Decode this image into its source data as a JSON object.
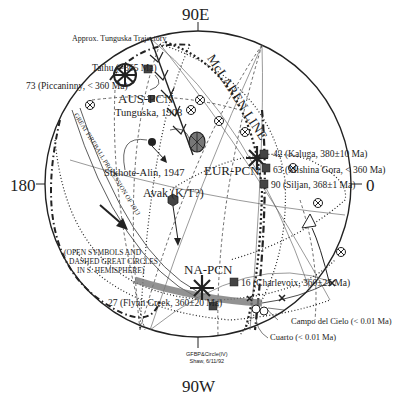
{
  "diagram": {
    "type": "stereographic polar projection",
    "axes": {
      "top": "90E",
      "bottom": "90W",
      "left": "180",
      "right": "0"
    },
    "titles": {
      "mclaren_line": "McLAREN LINE",
      "procession": "GREAT FIREBALL PROCESSION OF 1913",
      "trajectory": "Approx. Tunguska Trajectory"
    },
    "pole_clusters": {
      "aus": "AUS-PCN",
      "eur": "EUR-PCN",
      "na": "NA-PCN"
    },
    "sites": {
      "taihu": "Taihu (~365 Ma)",
      "piccaninny": "73 (Piccaninny, < 360 Ma)",
      "tunguska": "Tunguska, 1908",
      "sikhote": "Sikhote-Alin, 1947",
      "avak": "Avak (K/T?)",
      "kaluga": "42 (Kaluga, 380±10 Ma)",
      "mishina": "63 (Mishina Gora, < 360 Ma)",
      "siljan": "90 (Siljan, 368±1 Ma)",
      "charlevoix": "16 (Charlevoix, 360±25 Ma)",
      "flynn": "27 (Flynn Creek, 360±20 Ma)",
      "campo": "Campo del Cielo (< 0.01 Ma)",
      "cuarto": "Cuarto (< 0.01 Ma)"
    },
    "note": {
      "line1": "(OPEN SYMBOLS AND",
      "line2": "DASHED GREAT CIRCLES",
      "line3": "IN S. HEMISPHERE)"
    },
    "credit": {
      "line1": "GFBP&Circle(IV)",
      "line2": "Shaw, 6/11/92"
    },
    "colors": {
      "ink": "#222222",
      "marker_fill": "#444444",
      "band": "#666666",
      "background": "#ffffff"
    }
  }
}
